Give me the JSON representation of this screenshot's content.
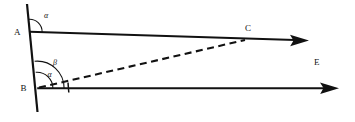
{
  "figure": {
    "type": "geometry-diagram",
    "width": 355,
    "height": 122,
    "background_color": "#ffffff",
    "line_color": "#111111"
  },
  "labels": {
    "point_a": "A",
    "point_b": "B",
    "point_c": "C",
    "point_e": "E",
    "angle_alpha_at_a": "α",
    "angle_beta_at_b": "β",
    "angle_alpha_at_b": "α"
  },
  "geometry": {
    "transversal_line": {
      "name": "steep-transversal",
      "x1": 27,
      "y1": 4,
      "x2": 37.5,
      "y2": 112,
      "style": "solid",
      "stroke_width": 2.2
    },
    "ray_from_a": {
      "name": "ray-a-through-c",
      "x1": 29.6,
      "y1": 31.8,
      "x2": 303,
      "y2": 40.3,
      "style": "solid",
      "stroke_width": 1.9,
      "arrow_tip_x": 309,
      "arrow_tip_y": 40.5
    },
    "ray_from_b": {
      "name": "ray-b-horizontal",
      "x1": 37.2,
      "y1": 88.2,
      "x2": 332,
      "y2": 88.2,
      "style": "solid",
      "stroke_width": 1.9,
      "arrow_tip_x": 339,
      "arrow_tip_y": 88.2
    },
    "segment_bc": {
      "name": "dashed-segment-b-to-c",
      "x1": 39,
      "y1": 87.6,
      "x2": 245,
      "y2": 40,
      "style": "dashed",
      "stroke_width": 2.1
    },
    "tick_mark": {
      "name": "tick-on-ray-b",
      "x1": 68,
      "y1": 82.5,
      "x2": 68.8,
      "y2": 92.5
    },
    "point_a_pos": {
      "x": 29.6,
      "y": 31.8
    },
    "point_b_pos": {
      "x": 37.2,
      "y": 88.2
    },
    "point_c_pos": {
      "x": 244.5,
      "y": 39.9
    }
  },
  "angle_arcs": {
    "alpha_at_a": {
      "cx": 29.6,
      "cy": 31.8,
      "r": 12.5,
      "note": "between transversal (up) and ray AC"
    },
    "beta_at_b": {
      "cx": 37.2,
      "cy": 88.2,
      "r": 27,
      "note": "between transversal (up) and ray BE"
    },
    "alpha_at_b": {
      "cx": 37.2,
      "cy": 88.2,
      "r": 16,
      "note": "between transversal (up) and dashed BC"
    }
  },
  "label_positions": {
    "point_a": {
      "x": 14,
      "y": 34.5
    },
    "point_b": {
      "x": 20.5,
      "y": 91
    },
    "point_c": {
      "x": 245,
      "y": 31
    },
    "point_e": {
      "x": 314,
      "y": 65
    },
    "angle_alpha_at_a": {
      "x": 44,
      "y": 18
    },
    "angle_beta_at_b": {
      "x": 53,
      "y": 65
    },
    "angle_alpha_at_b": {
      "x": 47.5,
      "y": 76.5
    }
  }
}
